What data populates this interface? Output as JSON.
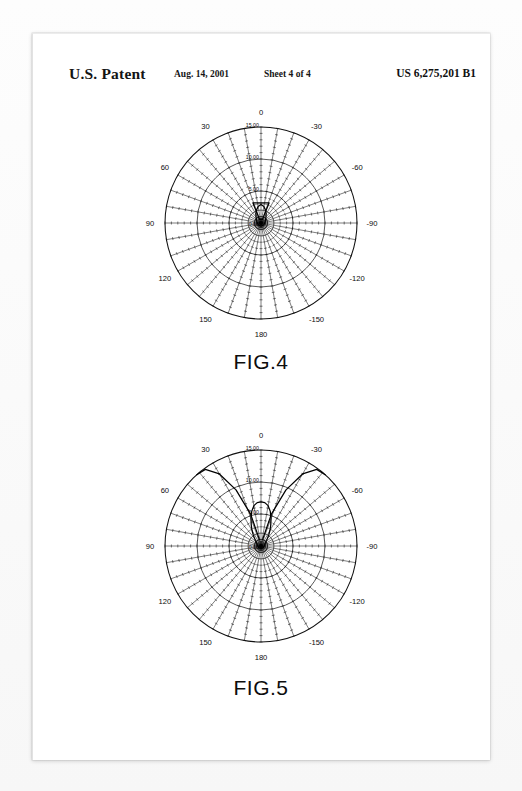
{
  "header": {
    "title": "U.S. Patent",
    "date": "Aug. 14, 2001",
    "sheet": "Sheet 4 of 4",
    "patent_number": "US 6,275,201 B1"
  },
  "figures": [
    {
      "id": "fig4",
      "caption": "FIG.4"
    },
    {
      "id": "fig5",
      "caption": "FIG.5"
    }
  ],
  "polar_grid": {
    "angle_labels": [
      "0",
      "30",
      "60",
      "90",
      "120",
      "150",
      "180",
      "-150",
      "-120",
      "-90",
      "-60",
      "-30"
    ],
    "angle_values": [
      0,
      30,
      60,
      90,
      120,
      150,
      180,
      -150,
      -120,
      -90,
      -60,
      -30
    ],
    "radial_labels": [
      "0.00",
      "5.00",
      "10.00",
      "15.00"
    ],
    "radial_values": [
      0,
      5,
      10,
      15
    ],
    "spoke_step_degrees": 10,
    "spoke_count": 36,
    "tick_count_per_spoke": 15,
    "rmax": 15
  },
  "chart_data": [
    {
      "type": "line",
      "plot": "polar",
      "title": "FIG.4",
      "xlabel": "Angle (degrees)",
      "ylabel": "Amplitude",
      "rlim": [
        0,
        15
      ],
      "rticks": [
        0,
        5,
        10,
        15
      ],
      "rtick_labels": [
        "0.00",
        "5.00",
        "10.00",
        "15.00"
      ],
      "thetaticks": [
        0,
        30,
        60,
        90,
        120,
        150,
        180,
        -150,
        -120,
        -90,
        -60,
        -30
      ],
      "grid": true,
      "legend": "none",
      "series": [
        {
          "name": "radiation pattern",
          "theta": [
            0,
            10,
            20,
            30,
            40,
            50,
            60,
            70,
            80,
            90,
            100,
            110,
            120,
            130,
            140,
            150,
            160,
            170,
            180,
            -170,
            -160,
            -150,
            -140,
            -130,
            -120,
            -110,
            -100,
            -90,
            -80,
            -70,
            -60,
            -50,
            -40,
            -30,
            -20,
            -10
          ],
          "r": [
            2.9,
            2.6,
            2.1,
            1.6,
            1.2,
            0.95,
            0.8,
            0.7,
            0.62,
            0.58,
            0.55,
            0.52,
            0.5,
            0.48,
            0.47,
            0.46,
            0.45,
            0.45,
            0.45,
            0.45,
            0.45,
            0.46,
            0.47,
            0.48,
            0.5,
            0.52,
            0.55,
            0.58,
            0.62,
            0.7,
            0.8,
            0.95,
            1.2,
            1.6,
            2.1,
            2.6
          ]
        },
        {
          "name": "box marker",
          "theta": [
            22,
            -22,
            -22,
            22,
            22
          ],
          "r": [
            3.4,
            3.4,
            0.6,
            0.6,
            3.4
          ]
        }
      ]
    },
    {
      "type": "line",
      "plot": "polar",
      "title": "FIG.5",
      "xlabel": "Angle (degrees)",
      "ylabel": "Amplitude",
      "rlim": [
        0,
        15
      ],
      "rticks": [
        0,
        5,
        10,
        15
      ],
      "rtick_labels": [
        "0.00",
        "5.00",
        "10.00",
        "15.00"
      ],
      "thetaticks": [
        0,
        30,
        60,
        90,
        120,
        150,
        180,
        -150,
        -120,
        -90,
        -60,
        -30
      ],
      "grid": true,
      "legend": "none",
      "series": [
        {
          "name": "main lobe",
          "theta": [
            0,
            5,
            10,
            15,
            20,
            25,
            30,
            35,
            40,
            45,
            50,
            60,
            70,
            80,
            90,
            110,
            130,
            150,
            180,
            -150,
            -130,
            -110,
            -90,
            -80,
            -70,
            -60,
            -50,
            -45,
            -40,
            -35,
            -30,
            -25,
            -20,
            -15,
            -10,
            -5
          ],
          "r": [
            6.9,
            6.8,
            6.4,
            5.6,
            4.6,
            3.6,
            2.8,
            2.1,
            1.6,
            1.25,
            1.0,
            0.75,
            0.62,
            0.55,
            0.5,
            0.45,
            0.42,
            0.4,
            0.38,
            0.4,
            0.42,
            0.45,
            0.5,
            0.55,
            0.62,
            0.75,
            1.0,
            1.25,
            1.6,
            2.1,
            2.8,
            3.6,
            4.6,
            5.6,
            6.4,
            6.8
          ]
        },
        {
          "name": "left side lobe",
          "theta": [
            14,
            18,
            24,
            30,
            36,
            42
          ],
          "r": [
            1.0,
            5.2,
            9.6,
            13.0,
            14.8,
            15.0
          ]
        },
        {
          "name": "right side lobe",
          "theta": [
            -14,
            -18,
            -24,
            -30,
            -36,
            -42
          ],
          "r": [
            1.0,
            5.2,
            9.6,
            13.0,
            14.8,
            15.0
          ]
        }
      ]
    }
  ]
}
